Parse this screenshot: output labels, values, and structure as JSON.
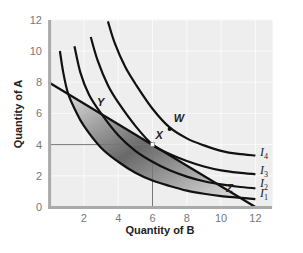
{
  "chart_data": {
    "type": "line",
    "title": "",
    "xlabel": "Quantity of B",
    "ylabel": "Quantity of A",
    "xlim": [
      0,
      13
    ],
    "ylim": [
      0,
      12
    ],
    "x_ticks": [
      2,
      4,
      6,
      8,
      10,
      12
    ],
    "y_ticks": [
      0,
      2,
      4,
      6,
      8,
      10,
      12
    ],
    "grid": true,
    "budget_line": {
      "name": "Budget line",
      "points": [
        [
          0,
          8
        ],
        [
          12,
          0
        ]
      ]
    },
    "series": [
      {
        "name": "I1",
        "label": "I",
        "sub": "1",
        "points": [
          [
            0.6,
            10.0
          ],
          [
            0.8,
            8.6
          ],
          [
            1.07,
            7.3
          ],
          [
            1.5,
            6.2
          ],
          [
            2,
            5.2
          ],
          [
            3,
            3.8
          ],
          [
            4,
            2.9
          ],
          [
            5,
            2.2
          ],
          [
            6,
            1.7
          ],
          [
            7,
            1.35
          ],
          [
            8,
            1.05
          ],
          [
            9,
            0.85
          ],
          [
            10,
            0.7
          ],
          [
            11,
            0.6
          ],
          [
            12,
            0.5
          ]
        ]
      },
      {
        "name": "I2",
        "label": "I",
        "sub": "2",
        "points": [
          [
            1.45,
            10.3
          ],
          [
            1.8,
            8.6
          ],
          [
            2.3,
            7.2
          ],
          [
            3,
            6.0
          ],
          [
            4,
            4.6
          ],
          [
            5,
            3.6
          ],
          [
            6,
            2.9
          ],
          [
            7,
            2.35
          ],
          [
            8,
            1.95
          ],
          [
            9,
            1.65
          ],
          [
            10,
            1.45
          ],
          [
            11,
            1.3
          ],
          [
            12,
            1.2
          ]
        ]
      },
      {
        "name": "I3",
        "label": "I",
        "sub": "3",
        "points": [
          [
            2.4,
            10.9
          ],
          [
            2.8,
            9.4
          ],
          [
            3.4,
            7.8
          ],
          [
            4,
            6.7
          ],
          [
            5,
            5.2
          ],
          [
            6,
            4.0
          ],
          [
            7,
            3.4
          ],
          [
            8,
            2.95
          ],
          [
            9,
            2.6
          ],
          [
            10,
            2.35
          ],
          [
            11,
            2.2
          ],
          [
            12,
            2.1
          ]
        ]
      },
      {
        "name": "I4",
        "label": "I",
        "sub": "4",
        "points": [
          [
            3.4,
            11.9
          ],
          [
            3.8,
            10.5
          ],
          [
            4.4,
            9.0
          ],
          [
            5,
            7.9
          ],
          [
            6,
            6.3
          ],
          [
            7,
            5.1
          ],
          [
            8,
            4.4
          ],
          [
            9,
            3.95
          ],
          [
            10,
            3.6
          ],
          [
            11,
            3.4
          ],
          [
            12,
            3.3
          ]
        ]
      }
    ],
    "points": [
      {
        "label": "Y",
        "x": 3,
        "y": 6
      },
      {
        "label": "X",
        "x": 6,
        "y": 4
      },
      {
        "label": "W",
        "x": 7,
        "y": 5
      },
      {
        "label": "Z",
        "x": 11,
        "y": 0.7
      }
    ],
    "reference_lines": {
      "x": 6,
      "y": 4
    },
    "shaded_region": "Area between budget line and I1",
    "legend": "none (curves labeled at right end)"
  }
}
